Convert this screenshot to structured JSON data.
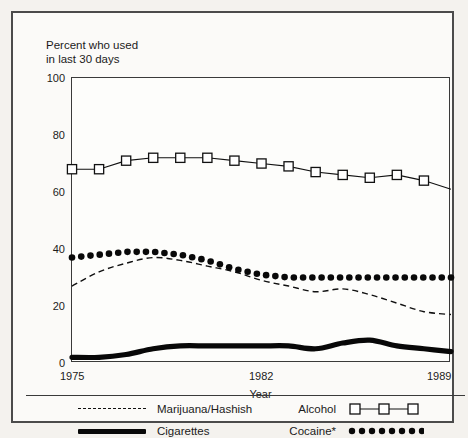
{
  "figure": {
    "y_axis_caption": "Percent who used\nin last 30 days",
    "x_axis_label": "Year"
  },
  "axes": {
    "yticks": [
      "0",
      "20",
      "40",
      "60",
      "80",
      "100"
    ],
    "xticks": [
      "1975",
      "1982",
      "1989"
    ]
  },
  "legend": {
    "marijuana": "Marijuana/Hashish",
    "cigarettes": "Cigarettes",
    "alcohol": "Alcohol",
    "cocaine": "Cocaine*"
  },
  "colors": {
    "ink": "#111111",
    "frame": "#3a3a3a",
    "outer_frame": "#4b4b4b",
    "page_background": "#f4f2ee",
    "plot_background": "#fdfdfb"
  },
  "chart_data": {
    "type": "line",
    "title": "",
    "subtitle": "",
    "xlabel": "Year",
    "ylabel": "Percent who used in last 30 days",
    "xlim": [
      1975,
      1989
    ],
    "ylim": [
      0,
      100
    ],
    "grid": false,
    "legend_position": "below-plot",
    "x": [
      1975,
      1976,
      1977,
      1978,
      1979,
      1980,
      1981,
      1982,
      1983,
      1984,
      1985,
      1986,
      1987,
      1988,
      1989
    ],
    "series": [
      {
        "name": "Alcohol",
        "marker": "open-square",
        "line": "thin-solid",
        "values": [
          68,
          68,
          71,
          72,
          72,
          72,
          71,
          70,
          69,
          67,
          66,
          65,
          66,
          64,
          61
        ]
      },
      {
        "name": "Cocaine*",
        "marker": "filled-dot",
        "line": "dotted",
        "values": [
          37,
          38,
          39,
          39,
          38,
          36,
          33,
          31,
          30,
          30,
          30,
          30,
          30,
          30,
          30
        ]
      },
      {
        "name": "Marijuana/Hashish",
        "marker": "none",
        "line": "dashed",
        "values": [
          27,
          32,
          35,
          37,
          36,
          34,
          32,
          29,
          27,
          25,
          26,
          24,
          21,
          18,
          17
        ]
      },
      {
        "name": "Cigarettes",
        "marker": "none",
        "line": "thick-solid",
        "values": [
          2,
          2,
          3,
          5,
          6,
          6,
          6,
          6,
          6,
          5,
          7,
          8,
          6,
          5,
          4
        ]
      }
    ]
  }
}
